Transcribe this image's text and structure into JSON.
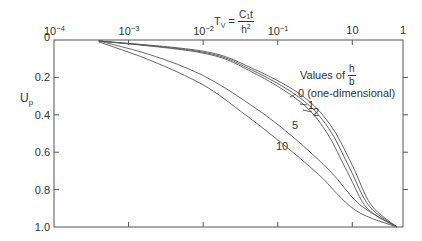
{
  "chart_data": {
    "type": "line",
    "title": "",
    "xlabel": "T_v = C_1 t / h^2",
    "xlabel_parts": {
      "lhs": "T",
      "lhs_sub": "V",
      "eq": " = ",
      "num_main": "C",
      "num_sub": "1",
      "num_tail": "t",
      "den_main": "h",
      "den_sup": "2"
    },
    "ylabel": "U_p",
    "ylabel_parts": {
      "main": "U",
      "sub": "p"
    },
    "x_scale": "log",
    "x_tick_labels": [
      {
        "base": "10",
        "exp": "−4"
      },
      {
        "base": "10",
        "exp": "−3"
      },
      {
        "base": "10",
        "exp": "−2"
      },
      {
        "base": "10",
        "exp": "−1"
      },
      {
        "base": "10",
        "exp": ""
      },
      {
        "base": "1",
        "exp": ""
      }
    ],
    "xlim_log10": [
      -4,
      0.68
    ],
    "y_tick_labels": [
      "0",
      "0.2",
      "0.4",
      "0.6",
      "0.8",
      "1.0"
    ],
    "ylim": [
      0,
      1.0
    ],
    "y_inverted": true,
    "grid": false,
    "legend": {
      "title_prefix": "Values of ",
      "title_frac_num": "h",
      "title_frac_den": "b",
      "entries": [
        "0 (one-dimensional)",
        "1",
        "2",
        "5",
        "10"
      ]
    },
    "series": [
      {
        "name": "0 (one-dimensional)",
        "log10_Tv": [
          -3.4,
          -2.0,
          -1.35,
          -0.7,
          -0.3,
          0.0,
          0.25,
          0.6
        ],
        "Up": [
          0.005,
          0.06,
          0.15,
          0.29,
          0.45,
          0.67,
          0.88,
          1.0
        ]
      },
      {
        "name": "1",
        "log10_Tv": [
          -3.4,
          -2.0,
          -1.35,
          -0.7,
          -0.32,
          -0.03,
          0.23,
          0.6
        ],
        "Up": [
          0.005,
          0.065,
          0.16,
          0.31,
          0.47,
          0.69,
          0.89,
          1.0
        ]
      },
      {
        "name": "2",
        "log10_Tv": [
          -3.4,
          -2.0,
          -1.35,
          -0.7,
          -0.35,
          -0.06,
          0.2,
          0.6
        ],
        "Up": [
          0.005,
          0.07,
          0.17,
          0.33,
          0.49,
          0.71,
          0.9,
          1.0
        ]
      },
      {
        "name": "5",
        "log10_Tv": [
          -3.4,
          -2.7,
          -2.0,
          -1.35,
          -0.82,
          -0.3,
          0.1,
          0.6
        ],
        "Up": [
          0.005,
          0.08,
          0.19,
          0.35,
          0.51,
          0.7,
          0.88,
          1.0
        ]
      },
      {
        "name": "10",
        "log10_Tv": [
          -3.4,
          -2.7,
          -2.0,
          -1.5,
          -0.95,
          -0.45,
          0.04,
          0.6
        ],
        "Up": [
          0.01,
          0.11,
          0.24,
          0.38,
          0.55,
          0.72,
          0.91,
          1.0
        ]
      }
    ],
    "annotations": [
      {
        "text": "0 (one-dimensional)"
      },
      {
        "text": "1"
      },
      {
        "text": "2"
      },
      {
        "text": "5"
      },
      {
        "text": "10"
      }
    ]
  },
  "colors": {
    "axis": "#555555",
    "curve": "#555555",
    "text": "#333333",
    "background": "#ffffff"
  }
}
